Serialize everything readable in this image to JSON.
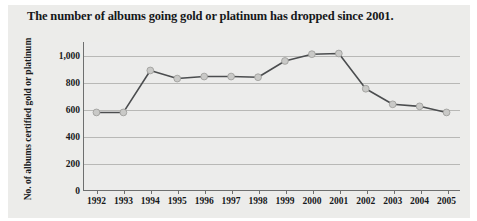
{
  "chart_data": {
    "type": "line",
    "title": "The number of albums going gold or platinum has dropped since 2001.",
    "xlabel": "",
    "ylabel": "No. of albums certified gold or platinum",
    "categories": [
      "1992",
      "1993",
      "1994",
      "1995",
      "1996",
      "1997",
      "1998",
      "1999",
      "2000",
      "2001",
      "2002",
      "2003",
      "2004",
      "2005"
    ],
    "values": [
      580,
      580,
      890,
      830,
      845,
      845,
      840,
      960,
      1010,
      1015,
      755,
      640,
      625,
      580
    ],
    "series": [
      {
        "name": "No. of albums certified gold or platinum",
        "values": [
          580,
          580,
          890,
          830,
          845,
          845,
          840,
          960,
          1010,
          1015,
          755,
          640,
          625,
          580
        ]
      }
    ],
    "ylim": [
      0,
      1100
    ],
    "yticks": [
      0,
      200,
      400,
      600,
      800,
      1000
    ],
    "ytick_labels": [
      "0",
      "200",
      "400",
      "600",
      "800",
      "1,000"
    ],
    "xlim": [
      "1992",
      "2005"
    ],
    "grid": "horizontal",
    "legend": "none",
    "marker": "circle",
    "colors": {
      "line": "#4b4d4f",
      "marker_fill": "#c9c9c7",
      "marker_edge": "#9a9a98",
      "gridline": "#b8b8b6",
      "axis": "#6e6f6f",
      "plot_background": "#ececeb",
      "panel_background": "#ececea",
      "text": "#17191b"
    }
  }
}
